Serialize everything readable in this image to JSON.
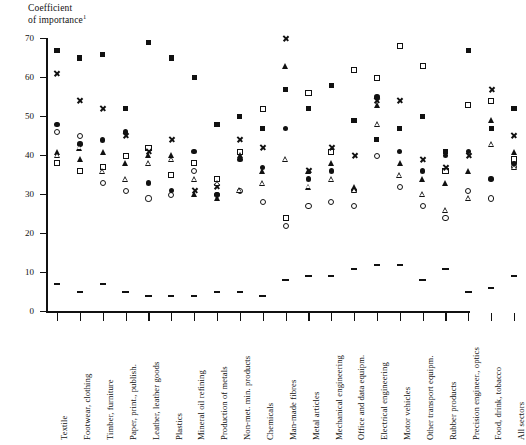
{
  "chart_data": {
    "type": "scatter",
    "title_superscript": "1",
    "xlabel": "",
    "ylabel": "",
    "ylim": [
      0,
      70
    ],
    "yticks": [
      0,
      10,
      20,
      30,
      40,
      50,
      60,
      70
    ],
    "grid": false,
    "legend_position": "none",
    "categories": [
      "Textile",
      "Footwear, clothing",
      "Timber, furniture",
      "Paper, print., publish.",
      "Leather, leather goods",
      "Plastics",
      "Mineral oil refining",
      "Production of metals",
      "Non-met. min. products",
      "Chemicals",
      "Man-made fibres",
      "Metal articles",
      "Mechanical engineering",
      "Office and data equipm.",
      "Electrical engineering",
      "Motor vehicles",
      "Other transport equipm.",
      "Rubber products",
      "Precision engineer., optics",
      "Food, drink, tobacco",
      "All sectors"
    ],
    "series": [
      {
        "name": "filled-square",
        "marker": "filled-square",
        "values": [
          67,
          65,
          66,
          52,
          69,
          65,
          60,
          48,
          50,
          47,
          57,
          52,
          58,
          49,
          44,
          47,
          50,
          41,
          67,
          47,
          52
        ]
      },
      {
        "name": "cross",
        "marker": "cross",
        "values": [
          61,
          54,
          52,
          45,
          41,
          44,
          31,
          32,
          44,
          42,
          70,
          36,
          42,
          40,
          54,
          54,
          39,
          37,
          40,
          57,
          45
        ]
      },
      {
        "name": "filled-circle",
        "marker": "filled-circle",
        "values": [
          48,
          43,
          44,
          46,
          33,
          31,
          41,
          30,
          39,
          37,
          47,
          34,
          36,
          31,
          55,
          41,
          36,
          40,
          41,
          34,
          38
        ]
      },
      {
        "name": "open-circle",
        "marker": "open-circle",
        "values": [
          46,
          45,
          33,
          31,
          29,
          30,
          36,
          30,
          31,
          28,
          22,
          27,
          28,
          27,
          40,
          32,
          27,
          24,
          31,
          29,
          37
        ]
      },
      {
        "name": "filled-triangle",
        "marker": "filled-triangle",
        "values": [
          41,
          39,
          41,
          38,
          40,
          40,
          30,
          29,
          40,
          36,
          63,
          36,
          38,
          32,
          53,
          38,
          34,
          33,
          36,
          49,
          41
        ]
      },
      {
        "name": "open-triangle",
        "marker": "open-triangle",
        "values": [
          40,
          42,
          36,
          34,
          38,
          39,
          34,
          33,
          31,
          33,
          39,
          32,
          34,
          31,
          48,
          35,
          30,
          26,
          29,
          43,
          37
        ]
      },
      {
        "name": "open-square",
        "marker": "open-square",
        "values": [
          38,
          36,
          37,
          40,
          42,
          35,
          38,
          34,
          41,
          52,
          24,
          56,
          41,
          62,
          60,
          68,
          63,
          36,
          53,
          54,
          39
        ]
      },
      {
        "name": "dash-low",
        "marker": "dash",
        "values": [
          7,
          5,
          7,
          5,
          4,
          4,
          4,
          5,
          5,
          4,
          8,
          9,
          9,
          11,
          12,
          12,
          8,
          11,
          5,
          6,
          9
        ]
      }
    ]
  },
  "axis": {
    "y_tick_labels": [
      "0",
      "10",
      "20",
      "30",
      "40",
      "50",
      "60",
      "70"
    ]
  }
}
